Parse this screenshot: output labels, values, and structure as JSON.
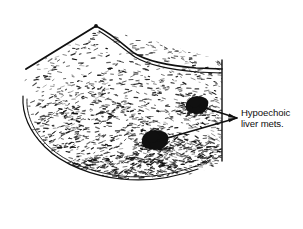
{
  "figure": {
    "kind": "ultrasound-sector-line-drawing",
    "modality_label": "ultrasound",
    "background_color": "#ffffff",
    "ink_color": "#101010",
    "width": 303,
    "height": 229
  },
  "annotation": {
    "line1": "Hypoechoic",
    "line2": "liver mets.",
    "full_text": "Hypoechoic liver mets.",
    "text_color": "#101010",
    "font_size_px": 9.6,
    "anchor_x": 241,
    "anchor_y": 107
  },
  "leader_lines": {
    "converge_x": 237,
    "converge_y": 118,
    "arrows": [
      {
        "name": "arrow-to-upper-lesion",
        "tip_x": 199,
        "tip_y": 106
      },
      {
        "name": "arrow-to-lower-lesion",
        "tip_x": 157,
        "tip_y": 141
      }
    ]
  },
  "lesions": [
    {
      "name": "hypoechoic-lesion-upper",
      "cx": 197,
      "cy": 105,
      "rx": 11,
      "ry": 9,
      "fill": "#101010"
    },
    {
      "name": "hypoechoic-lesion-lower",
      "cx": 155,
      "cy": 140,
      "rx": 13,
      "ry": 10,
      "fill": "#101010"
    }
  ],
  "scan_outline": {
    "apex_x": 96,
    "apex_y": 26,
    "left_edge_end_x": 26,
    "left_edge_end_y": 69,
    "right_edge_x": 222,
    "right_edge_top_y": 60,
    "right_edge_bottom_y": 161
  },
  "speckle": {
    "description": "ultrasound parenchymal speckle texture",
    "dash_color": "#101010",
    "seed": 20240517,
    "count": 1150
  }
}
